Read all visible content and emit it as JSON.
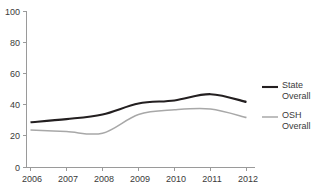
{
  "chart_data": {
    "type": "line",
    "title": "",
    "subtitle": "",
    "xlabel": "",
    "ylabel": "",
    "x": [
      "2006",
      "2007",
      "2008",
      "2009",
      "2010",
      "2011",
      "2012"
    ],
    "categories": [
      "2006",
      "2007",
      "2008",
      "2009",
      "2010",
      "2011",
      "2012"
    ],
    "series": [
      {
        "name": "State Overall",
        "legend_label_line1": "State",
        "legend_label_line2": "Overall",
        "color": "#231f20",
        "values": [
          29,
          31,
          34,
          41,
          43,
          47,
          42
        ]
      },
      {
        "name": "OSH Overall",
        "legend_label_line1": "OSH",
        "legend_label_line2": "Overall",
        "color": "#a8a8a8",
        "values": [
          24,
          23,
          22,
          34,
          37,
          37.5,
          32
        ]
      }
    ],
    "ylim": [
      0,
      100
    ],
    "y_ticks": [
      0,
      20,
      40,
      60,
      80,
      100
    ],
    "y_tick_labels": [
      "0",
      "20",
      "40",
      "60",
      "80",
      "100"
    ],
    "x_tick_labels": [
      "2006",
      "2007",
      "2008",
      "2009",
      "2010",
      "2011",
      "2012"
    ],
    "grid": false,
    "legend_position": "right",
    "axis_color": "#9a9a9a"
  },
  "legend": {
    "entries": [
      {
        "line1": "State",
        "line2": "Overall"
      },
      {
        "line1": "OSH",
        "line2": "Overall"
      }
    ]
  },
  "axes": {
    "y_labels": [
      "100",
      "80",
      "60",
      "40",
      "20",
      "0"
    ],
    "x_labels": [
      "2006",
      "2007",
      "2008",
      "2009",
      "2010",
      "2011",
      "2012"
    ]
  }
}
